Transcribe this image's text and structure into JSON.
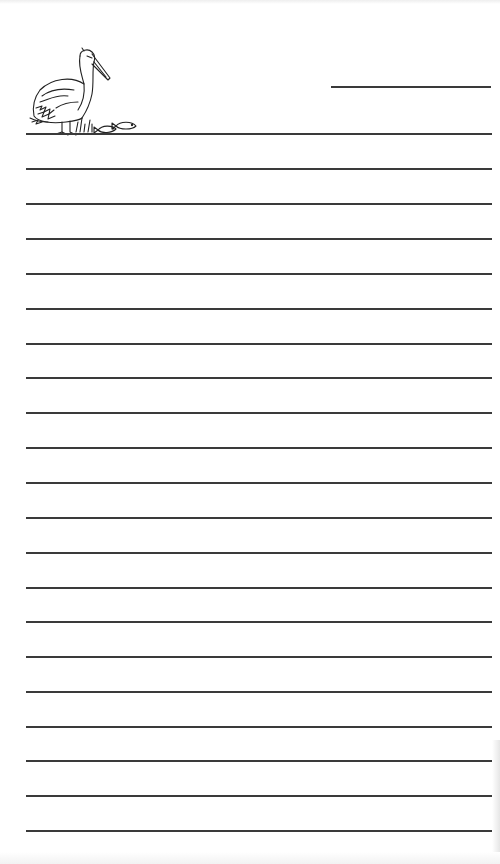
{
  "document": {
    "type": "lined-writing-paper",
    "illustration": "pelican-with-fish-icon",
    "header_line": {
      "x": 331,
      "y": 86,
      "width": 160
    },
    "rule_color": "#3a3a3a",
    "rules": {
      "left": 26,
      "right": 492,
      "y_positions": [
        133,
        168,
        203,
        238,
        273,
        308,
        343,
        377,
        412,
        447,
        482,
        517,
        552,
        587,
        621,
        656,
        691,
        726,
        760,
        795,
        830
      ]
    }
  }
}
